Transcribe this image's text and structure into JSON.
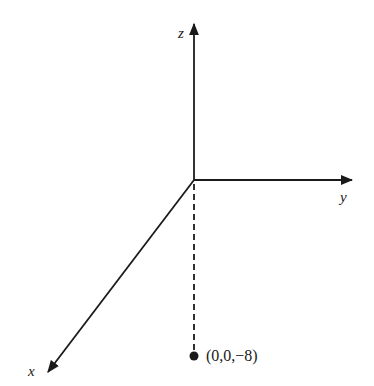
{
  "diagram": {
    "type": "3d-coordinate-axes",
    "axes": [
      {
        "name": "x",
        "label": "x",
        "direction": "toward-viewer (down-left)"
      },
      {
        "name": "y",
        "label": "y",
        "direction": "right"
      },
      {
        "name": "z",
        "label": "z",
        "direction": "up"
      }
    ],
    "point": {
      "label": "(0,0,−8)",
      "coords": [
        0,
        0,
        -8
      ]
    },
    "projection": {
      "style": "dashed",
      "from": "origin",
      "to": "point"
    },
    "colors": {
      "ink": "#1a1a1a",
      "background": "#ffffff"
    }
  }
}
